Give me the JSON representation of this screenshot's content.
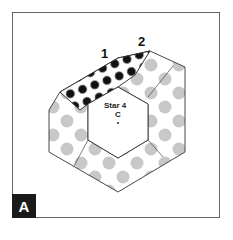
{
  "diagram": {
    "labels": {
      "piece_1": "1",
      "piece_2": "2",
      "center_title": "Star 4",
      "center_sub": "C",
      "panel_badge": "A"
    },
    "colors": {
      "frame": "#555555",
      "dot_gray": "#c8c8c8",
      "dot_black": "#111111",
      "badge_bg": "#1a1a1a",
      "badge_text": "#ffffff",
      "outline": "#333333"
    }
  }
}
